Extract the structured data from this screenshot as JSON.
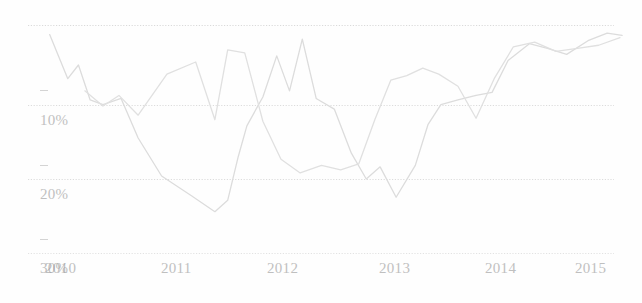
{
  "chart_data": {
    "type": "line",
    "title": "",
    "subtitle": "",
    "xlabel": "",
    "ylabel": "",
    "x_tick_labels": [
      "2010",
      "2011",
      "2012",
      "2013",
      "2014",
      "2015"
    ],
    "y_tick_labels": [
      "10%",
      "20%",
      "30%"
    ],
    "y_axis_inverted": true,
    "ylim": [
      0,
      30
    ],
    "xlim": [
      2009.9,
      2015.4
    ],
    "grid": "horizontal-dotted",
    "legend_position": "none",
    "axis_color": "#9a9a9a",
    "grid_color": "#d8d8d8",
    "series": [
      {
        "name": "series-1",
        "color": "#dcdcdc",
        "x": [
          2009.95,
          2010.12,
          2010.22,
          2010.33,
          2010.45,
          2010.62,
          2010.78,
          2011.0,
          2011.28,
          2011.5,
          2011.62,
          2011.72,
          2011.8,
          2011.95,
          2012.08,
          2012.2,
          2012.32,
          2012.45,
          2012.62,
          2012.78,
          2012.92,
          2013.05,
          2013.2,
          2013.38,
          2013.5,
          2013.62,
          2013.78,
          2013.95,
          2014.1,
          2014.25,
          2014.45,
          2014.62,
          2014.8,
          2015.0,
          2015.18,
          2015.32
        ],
        "values": [
          1.2,
          7.0,
          5.2,
          9.8,
          10.4,
          9.6,
          14.8,
          19.8,
          22.4,
          24.5,
          23.0,
          17.2,
          13.2,
          9.4,
          4.0,
          8.6,
          1.8,
          9.6,
          11.0,
          16.8,
          20.2,
          18.6,
          22.6,
          18.4,
          13.0,
          10.4,
          9.8,
          9.2,
          8.8,
          4.6,
          2.4,
          3.0,
          3.8,
          2.0,
          1.0,
          1.3
        ]
      },
      {
        "name": "series-2",
        "color": "#e0e0e0",
        "x": [
          2010.28,
          2010.45,
          2010.6,
          2010.78,
          2011.05,
          2011.32,
          2011.5,
          2011.62,
          2011.78,
          2011.95,
          2012.12,
          2012.3,
          2012.5,
          2012.68,
          2012.85,
          2013.0,
          2013.15,
          2013.3,
          2013.45,
          2013.6,
          2013.78,
          2013.95,
          2014.12,
          2014.3,
          2014.5,
          2014.7,
          2014.9,
          2015.1,
          2015.3
        ],
        "values": [
          8.6,
          10.6,
          9.2,
          11.8,
          6.4,
          4.8,
          12.4,
          3.2,
          3.6,
          12.6,
          17.6,
          19.4,
          18.4,
          19.0,
          18.2,
          12.4,
          7.2,
          6.6,
          5.6,
          6.4,
          8.0,
          12.2,
          7.0,
          2.8,
          2.2,
          3.4,
          3.0,
          2.6,
          1.6
        ]
      }
    ]
  },
  "y_axis": {
    "ticks": [
      {
        "label": "10%",
        "value": 10
      },
      {
        "label": "20%",
        "value": 20
      },
      {
        "label": "30%",
        "value": 30
      }
    ]
  },
  "x_axis": {
    "ticks": [
      {
        "label": "2010",
        "value": 2010
      },
      {
        "label": "2011",
        "value": 2011
      },
      {
        "label": "2012",
        "value": 2012
      },
      {
        "label": "2013",
        "value": 2013
      },
      {
        "label": "2014",
        "value": 2014
      },
      {
        "label": "2015",
        "value": 2015
      }
    ]
  }
}
